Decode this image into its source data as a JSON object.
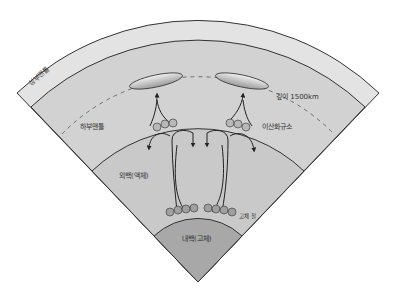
{
  "diagram": {
    "title": "",
    "type": "earth-cross-section-wedge",
    "labels": {
      "upper_mantle": "상부맨틀",
      "lower_mantle": "하부맨틀",
      "outer_core": "외핵(액체)",
      "inner_core": "내핵(고체)",
      "depth": "깊이 1500km",
      "silicon_dioxide": "이산화규소",
      "solid_iron": "고체 철"
    },
    "layers": [
      {
        "name": "upper_mantle",
        "label": "상부맨틀",
        "color": "#e3e3e3"
      },
      {
        "name": "lower_mantle",
        "label": "하부맨틀",
        "color": "#d2d2d2"
      },
      {
        "name": "outer_core",
        "label": "외핵(액체)",
        "color": "#c9c9c9"
      },
      {
        "name": "inner_core",
        "label": "내핵(고체)",
        "color": "#a8a8a8"
      }
    ],
    "features": {
      "blobs_count": 2,
      "dashed_line_label": "깊이 1500km",
      "particle_clusters": [
        "이산화규소 at core-mantle boundary",
        "고체 철 at inner core boundary"
      ],
      "flow_arrows": "convection arrows in outer core rising then curling down"
    },
    "colors": {
      "outline": "#333333",
      "particle_fill": "#b0b0b0",
      "blob_fill": "#bdbdbd"
    }
  }
}
